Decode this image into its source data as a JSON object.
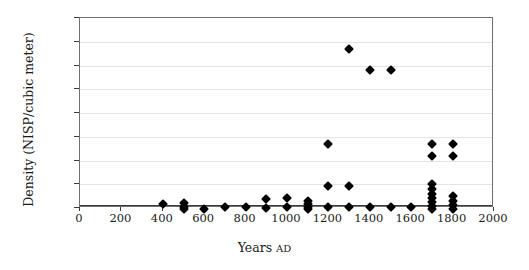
{
  "chart_data": {
    "type": "scatter",
    "title": "",
    "xlabel": "Years AD",
    "xlabel_main": "Years",
    "xlabel_suffix": "AD",
    "ylabel": "Density (NISP/cubic meter)",
    "xlim": [
      0,
      2000
    ],
    "ylim": [
      0,
      1600
    ],
    "xticks": [
      0,
      200,
      400,
      600,
      800,
      1000,
      1200,
      1400,
      1600,
      1800,
      2000
    ],
    "yticks": [
      0,
      200,
      400,
      600,
      800,
      1000,
      1200,
      1400,
      1600
    ],
    "grid": "horizontal",
    "legend": "none",
    "marker": "diamond",
    "marker_color": "#000000",
    "points": [
      {
        "x": 400,
        "y": 50
      },
      {
        "x": 500,
        "y": 55
      },
      {
        "x": 500,
        "y": 20
      },
      {
        "x": 500,
        "y": 5
      },
      {
        "x": 600,
        "y": 5
      },
      {
        "x": 700,
        "y": 20
      },
      {
        "x": 800,
        "y": 20
      },
      {
        "x": 900,
        "y": 90
      },
      {
        "x": 900,
        "y": 15
      },
      {
        "x": 1000,
        "y": 95
      },
      {
        "x": 1000,
        "y": 20
      },
      {
        "x": 1100,
        "y": 75
      },
      {
        "x": 1100,
        "y": 45
      },
      {
        "x": 1100,
        "y": 25
      },
      {
        "x": 1100,
        "y": 5
      },
      {
        "x": 1200,
        "y": 550
      },
      {
        "x": 1200,
        "y": 195
      },
      {
        "x": 1200,
        "y": 20
      },
      {
        "x": 1300,
        "y": 1350
      },
      {
        "x": 1300,
        "y": 195
      },
      {
        "x": 1300,
        "y": 20
      },
      {
        "x": 1400,
        "y": 1175
      },
      {
        "x": 1400,
        "y": 20
      },
      {
        "x": 1500,
        "y": 1175
      },
      {
        "x": 1500,
        "y": 20
      },
      {
        "x": 1600,
        "y": 20
      },
      {
        "x": 1700,
        "y": 550
      },
      {
        "x": 1700,
        "y": 450
      },
      {
        "x": 1700,
        "y": 215
      },
      {
        "x": 1700,
        "y": 170
      },
      {
        "x": 1700,
        "y": 130
      },
      {
        "x": 1700,
        "y": 95
      },
      {
        "x": 1700,
        "y": 60
      },
      {
        "x": 1700,
        "y": 30
      },
      {
        "x": 1700,
        "y": 5
      },
      {
        "x": 1800,
        "y": 550
      },
      {
        "x": 1800,
        "y": 450
      },
      {
        "x": 1800,
        "y": 110
      },
      {
        "x": 1800,
        "y": 75
      },
      {
        "x": 1800,
        "y": 35
      },
      {
        "x": 1800,
        "y": 5
      }
    ]
  }
}
